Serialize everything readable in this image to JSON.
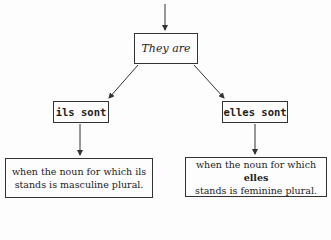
{
  "diagram": {
    "root": {
      "label": "They are"
    },
    "branches": [
      {
        "label": "ils sont",
        "explanation": {
          "line1_prefix": "when the noun for which ",
          "keyword": "ils",
          "line2": "stands is masculine plural."
        }
      },
      {
        "label": "elles sont",
        "explanation": {
          "line1_prefix": "when the noun for which ",
          "keyword": "elles",
          "line2": "stands is feminine plural."
        }
      }
    ]
  },
  "colors": {
    "ink": "#1e1e1e",
    "paper": "#fdfdfd"
  }
}
